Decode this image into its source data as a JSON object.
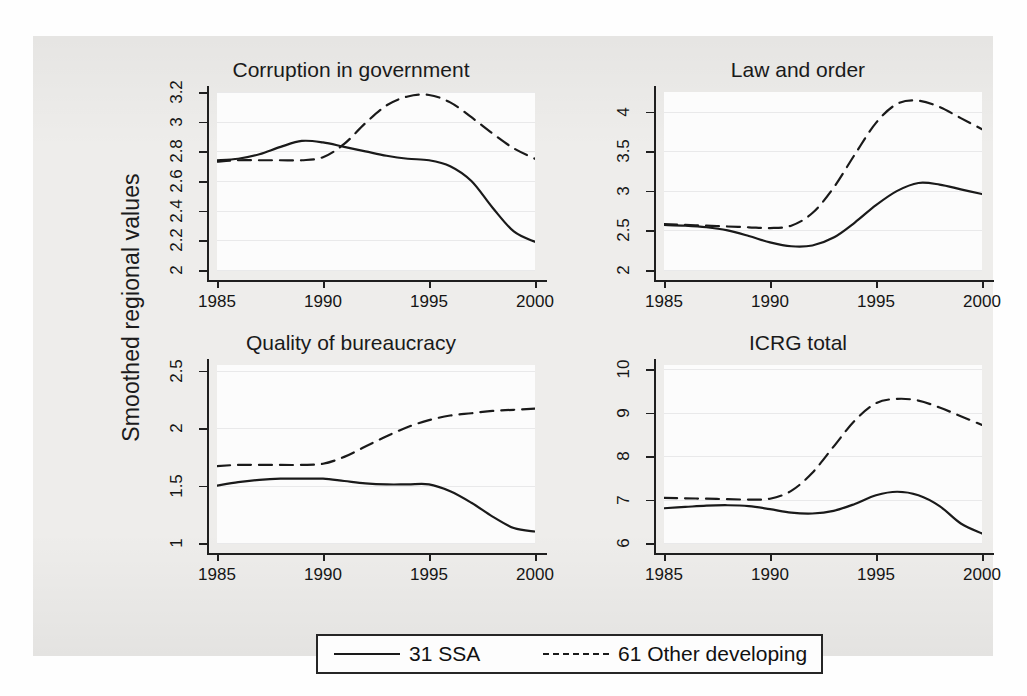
{
  "figure": {
    "y_axis_label": "Smoothed regional values",
    "background_color": "#eeedeb",
    "plot_background_color": "#fcfcfc",
    "line_color": "#1a1a1a",
    "grid_color": "#e9e9ea"
  },
  "legend": {
    "entries": [
      {
        "label": "31 SSA",
        "style": "solid"
      },
      {
        "label": "61 Other developing",
        "style": "dashed"
      }
    ]
  },
  "chart_data": [
    {
      "type": "line",
      "title": "Corruption in government",
      "xlabel": "",
      "ylabel": "Smoothed regional values",
      "xlim": [
        1985,
        2000
      ],
      "ylim": [
        2,
        3.2
      ],
      "grid": true,
      "legend_position": "bottom",
      "xticks": [
        1985,
        1990,
        1995,
        2000
      ],
      "xtick_labels": [
        "1985",
        "1990",
        "1995",
        "2000"
      ],
      "yticks": [
        2,
        2.2,
        2.4,
        2.6,
        2.8,
        3,
        3.2
      ],
      "ytick_labels": [
        "2",
        "2.2",
        "2.4",
        "2.6",
        "2.8",
        "3",
        "3.2"
      ],
      "x": [
        1985,
        1986,
        1987,
        1988,
        1989,
        1990,
        1991,
        1992,
        1993,
        1994,
        1995,
        1996,
        1997,
        1998,
        1999,
        2000
      ],
      "series": [
        {
          "name": "31 SSA",
          "style": "solid",
          "values": [
            2.74,
            2.75,
            2.78,
            2.83,
            2.87,
            2.86,
            2.83,
            2.8,
            2.77,
            2.75,
            2.74,
            2.7,
            2.6,
            2.42,
            2.26,
            2.19
          ]
        },
        {
          "name": "61 Other developing",
          "style": "dashed",
          "values": [
            2.73,
            2.74,
            2.74,
            2.74,
            2.74,
            2.76,
            2.85,
            2.99,
            3.11,
            3.17,
            3.18,
            3.13,
            3.03,
            2.92,
            2.82,
            2.75
          ]
        }
      ]
    },
    {
      "type": "line",
      "title": "Law and order",
      "xlabel": "",
      "ylabel": "Smoothed regional values",
      "xlim": [
        1985,
        2000
      ],
      "ylim": [
        2,
        4.25
      ],
      "grid": true,
      "legend_position": "bottom",
      "xticks": [
        1985,
        1990,
        1995,
        2000
      ],
      "xtick_labels": [
        "1985",
        "1990",
        "1995",
        "2000"
      ],
      "yticks": [
        2,
        2.5,
        3,
        3.5,
        4
      ],
      "ytick_labels": [
        "2",
        "2.5",
        "3",
        "3.5",
        "4"
      ],
      "x": [
        1985,
        1986,
        1987,
        1988,
        1989,
        1990,
        1991,
        1992,
        1993,
        1994,
        1995,
        1996,
        1997,
        1998,
        1999,
        2000
      ],
      "series": [
        {
          "name": "31 SSA",
          "style": "solid",
          "values": [
            2.57,
            2.56,
            2.54,
            2.5,
            2.43,
            2.35,
            2.3,
            2.31,
            2.41,
            2.6,
            2.82,
            3.0,
            3.1,
            3.08,
            3.02,
            2.96
          ]
        },
        {
          "name": "61 Other developing",
          "style": "dashed",
          "values": [
            2.58,
            2.57,
            2.56,
            2.55,
            2.54,
            2.53,
            2.56,
            2.72,
            3.04,
            3.46,
            3.86,
            4.1,
            4.14,
            4.06,
            3.92,
            3.78
          ]
        }
      ]
    },
    {
      "type": "line",
      "title": "Quality of bureaucracy",
      "xlabel": "",
      "ylabel": "Smoothed regional values",
      "xlim": [
        1985,
        2000
      ],
      "ylim": [
        1,
        2.55
      ],
      "grid": true,
      "legend_position": "bottom",
      "xticks": [
        1985,
        1990,
        1995,
        2000
      ],
      "xtick_labels": [
        "1985",
        "1990",
        "1995",
        "2000"
      ],
      "yticks": [
        1,
        1.5,
        2,
        2.5
      ],
      "ytick_labels": [
        "1",
        "1.5",
        "2",
        "2.5"
      ],
      "x": [
        1985,
        1986,
        1987,
        1988,
        1989,
        1990,
        1991,
        1992,
        1993,
        1994,
        1995,
        1996,
        1997,
        1998,
        1999,
        2000
      ],
      "series": [
        {
          "name": "31 SSA",
          "style": "solid",
          "values": [
            1.5,
            1.53,
            1.55,
            1.56,
            1.56,
            1.56,
            1.54,
            1.52,
            1.51,
            1.51,
            1.51,
            1.45,
            1.35,
            1.23,
            1.13,
            1.1
          ]
        },
        {
          "name": "61 Other developing",
          "style": "dashed",
          "values": [
            1.67,
            1.68,
            1.68,
            1.68,
            1.68,
            1.69,
            1.75,
            1.84,
            1.93,
            2.01,
            2.07,
            2.11,
            2.13,
            2.15,
            2.16,
            2.17
          ]
        }
      ]
    },
    {
      "type": "line",
      "title": "ICRG total",
      "xlabel": "",
      "ylabel": "Smoothed regional values",
      "xlim": [
        1985,
        2000
      ],
      "ylim": [
        6,
        10.1
      ],
      "grid": true,
      "legend_position": "bottom",
      "xticks": [
        1985,
        1990,
        1995,
        2000
      ],
      "xtick_labels": [
        "1985",
        "1990",
        "1995",
        "2000"
      ],
      "yticks": [
        6,
        7,
        8,
        9,
        10
      ],
      "ytick_labels": [
        "6",
        "7",
        "8",
        "9",
        "10"
      ],
      "x": [
        1985,
        1986,
        1987,
        1988,
        1989,
        1990,
        1991,
        1992,
        1993,
        1994,
        1995,
        1996,
        1997,
        1998,
        1999,
        2000
      ],
      "series": [
        {
          "name": "31 SSA",
          "style": "solid",
          "values": [
            6.8,
            6.83,
            6.86,
            6.87,
            6.85,
            6.78,
            6.7,
            6.68,
            6.74,
            6.9,
            7.1,
            7.18,
            7.1,
            6.85,
            6.45,
            6.22
          ]
        },
        {
          "name": "61 Other developing",
          "style": "dashed",
          "values": [
            7.04,
            7.03,
            7.02,
            7.01,
            7.0,
            7.02,
            7.2,
            7.62,
            8.22,
            8.82,
            9.22,
            9.32,
            9.28,
            9.12,
            8.92,
            8.72
          ]
        }
      ]
    }
  ]
}
